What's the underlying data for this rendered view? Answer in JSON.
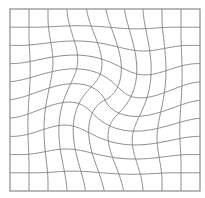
{
  "diagram": {
    "type": "swirl-distorted-grid",
    "frame": {
      "x": 10,
      "y": 9,
      "width": 190,
      "height": 182
    },
    "cells_x": 10,
    "cells_y": 10,
    "swirl": {
      "center_x": 105,
      "center_y": 100,
      "radius": 100,
      "strength_rad": 1.15,
      "direction": "clockwise"
    },
    "colors": {
      "background": "#ffffff",
      "line": "#8a8a8a"
    }
  }
}
